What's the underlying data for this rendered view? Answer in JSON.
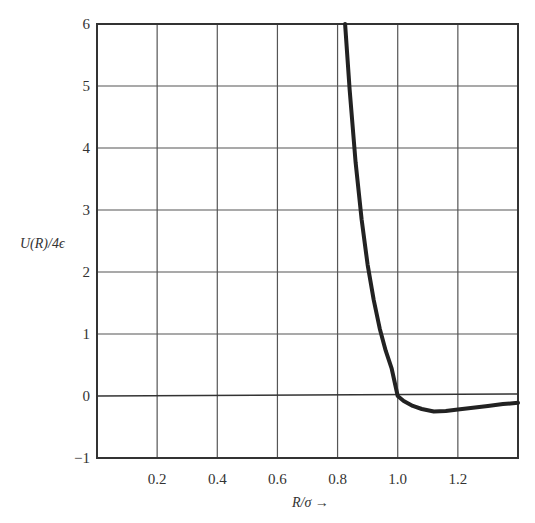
{
  "chart_data": {
    "type": "line",
    "title": "",
    "xlabel": "R/σ →",
    "ylabel": "U(R)/4ϵ",
    "xlim": [
      0.0,
      1.4
    ],
    "ylim": [
      -1,
      6
    ],
    "grid": true,
    "legend": null,
    "x_ticks": [
      0.2,
      0.4,
      0.6,
      0.8,
      1.0,
      1.2
    ],
    "x_tick_labels": [
      "0.2",
      "0.4",
      "0.6",
      "0.8",
      "1.0",
      "1.2"
    ],
    "y_ticks": [
      -1,
      0,
      1,
      2,
      3,
      4,
      5,
      6
    ],
    "y_tick_labels": [
      "−1",
      "0",
      "1",
      "2",
      "3",
      "4",
      "5",
      "6"
    ],
    "series": [
      {
        "name": "Lennard-Jones potential",
        "x": [
          0.825,
          0.84,
          0.86,
          0.88,
          0.9,
          0.92,
          0.94,
          0.96,
          0.98,
          1.0,
          1.02,
          1.05,
          1.08,
          1.12,
          1.16,
          1.2,
          1.25,
          1.3,
          1.35,
          1.4
        ],
        "values": [
          6.0,
          4.95,
          3.77,
          2.85,
          2.12,
          1.55,
          1.09,
          0.73,
          0.44,
          0.0,
          -0.08,
          -0.16,
          -0.21,
          -0.25,
          -0.24,
          -0.22,
          -0.19,
          -0.16,
          -0.13,
          -0.11
        ]
      }
    ]
  },
  "labels": {
    "xlabel": "R/σ →",
    "ylabel": "U(R)/4ϵ"
  }
}
